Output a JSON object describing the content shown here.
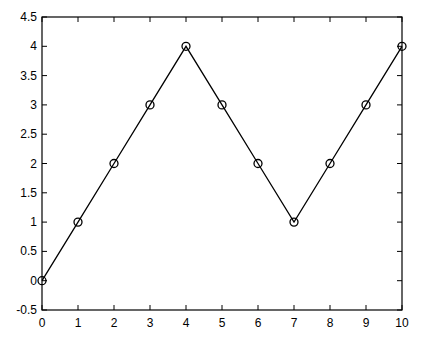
{
  "chart_data": {
    "type": "line",
    "title": "",
    "xlabel": "",
    "ylabel": "",
    "x": [
      0,
      1,
      2,
      3,
      4,
      5,
      6,
      7,
      8,
      9,
      10
    ],
    "series": [
      {
        "name": "",
        "values": [
          0,
          1,
          2,
          3,
          4,
          3,
          2,
          1,
          2,
          3,
          4
        ],
        "marker": "circle",
        "color": "#000000"
      }
    ],
    "xlim": [
      0,
      10
    ],
    "ylim": [
      -0.5,
      4.5
    ],
    "xticks": [
      0,
      1,
      2,
      3,
      4,
      5,
      6,
      7,
      8,
      9,
      10
    ],
    "xtick_labels": [
      "0",
      "1",
      "2",
      "3",
      "4",
      "5",
      "6",
      "7",
      "8",
      "9",
      "10"
    ],
    "yticks": [
      -0.5,
      0,
      0.5,
      1,
      1.5,
      2,
      2.5,
      3,
      3.5,
      4,
      4.5
    ],
    "ytick_labels": [
      "-0.5",
      "0",
      "0.5",
      "1",
      "1.5",
      "2",
      "2.5",
      "3",
      "3.5",
      "4",
      "4.5"
    ],
    "grid": false,
    "legend": null
  }
}
